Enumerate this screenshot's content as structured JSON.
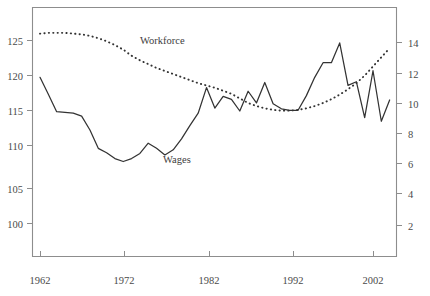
{
  "chart_data": {
    "type": "line",
    "title": "",
    "subtitle": "",
    "xlabel": "",
    "ylabel": "",
    "grid": false,
    "legend_position": "inline-annotation",
    "x_axis": {
      "tick_labels": [
        "1962",
        "1972",
        "1982",
        "1992",
        "2002"
      ],
      "tick_values": [
        1962,
        1972,
        1982,
        1992,
        2002
      ],
      "range": [
        1961,
        2005
      ]
    },
    "y_axis_left": {
      "label": "",
      "tick_labels": [
        "100",
        "105",
        "110",
        "115",
        "120",
        "125"
      ],
      "tick_values": [
        100,
        105,
        110,
        115,
        120,
        125
      ],
      "range": [
        96.5,
        128.5
      ],
      "applies_to": "Wages"
    },
    "y_axis_right": {
      "label": "",
      "tick_labels": [
        "2",
        "4",
        "6",
        "8",
        "10",
        "12",
        "14"
      ],
      "tick_values": [
        2,
        4,
        6,
        8,
        10,
        12,
        14
      ],
      "range": [
        0.5,
        15.0
      ],
      "applies_to": "Workforce"
    },
    "series": [
      {
        "name": "Wages",
        "style": "solid",
        "axis": "left",
        "annotation_label": "Wages",
        "x": [
          1962,
          1963,
          1964,
          1965,
          1966,
          1967,
          1968,
          1969,
          1970,
          1971,
          1972,
          1973,
          1974,
          1975,
          1976,
          1977,
          1978,
          1979,
          1980,
          1981,
          1982,
          1983,
          1984,
          1985,
          1986,
          1987,
          1988,
          1989,
          1990,
          1991,
          1992,
          1993,
          1994,
          1995,
          1996,
          1997,
          1998,
          1999,
          2000,
          2001,
          2002,
          2003,
          2004
        ],
        "values": [
          119.9,
          117.6,
          115.2,
          115.1,
          115.0,
          114.6,
          112.7,
          110.2,
          109.6,
          108.8,
          108.4,
          108.8,
          109.5,
          110.9,
          110.2,
          109.3,
          110.0,
          111.5,
          113.3,
          115.0,
          118.5,
          115.7,
          117.3,
          116.9,
          115.3,
          118.0,
          116.4,
          119.2,
          116.3,
          115.6,
          115.4,
          115.4,
          117.4,
          119.9,
          121.9,
          121.9,
          124.6,
          118.8,
          119.3,
          114.4,
          120.8,
          113.9,
          116.8
        ]
      },
      {
        "name": "Workforce",
        "style": "dotted",
        "axis": "right",
        "annotation_label": "Workforce",
        "x": [
          1962,
          1963,
          1964,
          1965,
          1966,
          1967,
          1968,
          1969,
          1970,
          1971,
          1972,
          1973,
          1974,
          1975,
          1976,
          1977,
          1978,
          1979,
          1980,
          1981,
          1982,
          1983,
          1984,
          1985,
          1986,
          1987,
          1988,
          1989,
          1990,
          1991,
          1992,
          1993,
          1994,
          1995,
          1996,
          1997,
          1998,
          1999,
          2000,
          2001,
          2002,
          2003,
          2004
        ],
        "values": [
          14.55,
          14.6,
          14.6,
          14.6,
          14.55,
          14.5,
          14.4,
          14.25,
          14.05,
          13.8,
          13.5,
          13.1,
          12.8,
          12.55,
          12.3,
          12.1,
          11.9,
          11.7,
          11.5,
          11.3,
          11.15,
          11.0,
          10.8,
          10.6,
          10.3,
          10.0,
          9.8,
          9.65,
          9.55,
          9.5,
          9.5,
          9.55,
          9.65,
          9.8,
          10.0,
          10.25,
          10.55,
          10.9,
          11.3,
          11.8,
          12.4,
          13.0,
          13.6
        ]
      }
    ],
    "annotations": [
      {
        "text": "Workforce",
        "x_px": 140,
        "y_px": 44
      },
      {
        "text": "Wages",
        "x_px": 163,
        "y_px": 163
      }
    ]
  },
  "plot": {
    "frame": {
      "left": 32,
      "top": 7,
      "right": 397,
      "bottom": 257
    }
  }
}
